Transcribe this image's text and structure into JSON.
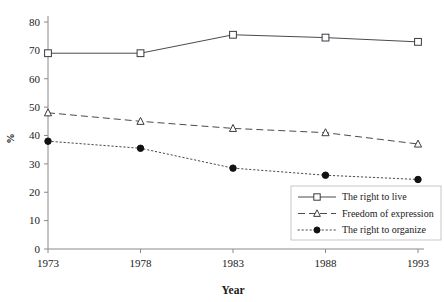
{
  "chart_data": {
    "type": "line",
    "title": "",
    "subtitle": "",
    "xlabel": "Year",
    "ylabel": "%",
    "categories": [
      "1973",
      "1978",
      "1983",
      "1988",
      "1993"
    ],
    "x": [
      1973,
      1978,
      1983,
      1988,
      1993
    ],
    "xlim": [
      1973,
      1993
    ],
    "ylim": [
      0,
      80
    ],
    "ytick_labels": [
      "0",
      "10",
      "20",
      "30",
      "40",
      "50",
      "60",
      "70",
      "80"
    ],
    "ytick_values": [
      0,
      10,
      20,
      30,
      40,
      50,
      60,
      70,
      80
    ],
    "xtick_labels": [
      "1973",
      "1978",
      "1983",
      "1988",
      "1993"
    ],
    "grid": false,
    "legend_position": "bottom-right",
    "series": [
      {
        "name": "The right to live",
        "values": [
          69,
          69,
          75.5,
          74.5,
          73
        ],
        "line_style": "solid",
        "marker": "open-square"
      },
      {
        "name": "Freedom of expression",
        "values": [
          48,
          45,
          42.5,
          41,
          37
        ],
        "line_style": "dashed",
        "marker": "open-triangle"
      },
      {
        "name": "The right to organize",
        "values": [
          38,
          35.5,
          28.5,
          26,
          24.5
        ],
        "line_style": "dotted",
        "marker": "filled-circle"
      }
    ]
  },
  "legend": {
    "entries": [
      {
        "label": "The right to live"
      },
      {
        "label": "Freedom of expression"
      },
      {
        "label": "The right to organize"
      }
    ]
  },
  "colors": {
    "line": "#4a4a52",
    "axis": "#8a8a8a",
    "text": "#1a1a1a",
    "marker_fill_open": "#ffffff",
    "marker_fill_solid": "#121212",
    "background": "#ffffff"
  }
}
